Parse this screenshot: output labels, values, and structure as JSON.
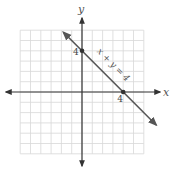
{
  "chart_data": {
    "type": "line",
    "title": "",
    "xlabel": "x",
    "ylabel": "y",
    "xlim": [
      -7,
      6
    ],
    "ylim": [
      -6,
      6
    ],
    "grid": true,
    "grid_range": {
      "x": [
        -6,
        6
      ],
      "y": [
        -6,
        6
      ]
    },
    "series": [
      {
        "name": "x + y = 4",
        "equation_label": "x + y = 4",
        "x": [
          -1.8,
          7.2
        ],
        "y": [
          5.8,
          -3.2
        ],
        "points": [
          {
            "x": 0,
            "y": 4,
            "label": "4"
          },
          {
            "x": 4,
            "y": 0,
            "label": "4"
          }
        ]
      }
    ],
    "tick_labels": {
      "x_intercept": "4",
      "y_intercept": "4"
    },
    "colors": {
      "axis": "#333333",
      "line": "#555555",
      "grid": "#d8d8d8"
    }
  }
}
